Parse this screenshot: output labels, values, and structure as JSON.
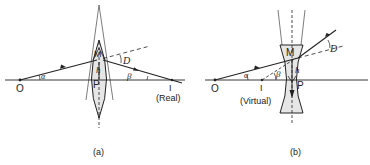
{
  "figure_a": {
    "caption": "(a)",
    "object_label": "O",
    "image_label": "I",
    "image_type": "(Real)",
    "point_m": "M",
    "point_p": "P",
    "height_label": "h",
    "angle_alpha": "α",
    "angle_beta": "β",
    "deviation_label": "D",
    "lens_type": "converging"
  },
  "figure_b": {
    "caption": "(b)",
    "object_label": "O",
    "image_label": "I",
    "image_type": "(Virtual)",
    "point_m": "M",
    "point_p": "P",
    "height_label": "h",
    "angle_alpha": "α",
    "angle_beta": "β",
    "deviation_label": "D",
    "lens_type": "diverging"
  },
  "colors": {
    "line": "#222222",
    "lens_fill": "#e6e6e6"
  }
}
